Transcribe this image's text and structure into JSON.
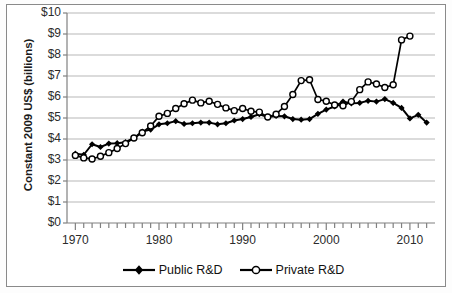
{
  "chart_data": {
    "type": "line",
    "title": "",
    "xlabel": "",
    "ylabel": "Constant 2009 US$ (billions)",
    "xlim": [
      1969,
      2013
    ],
    "ylim": [
      0,
      10
    ],
    "xticks": [
      1970,
      1980,
      1990,
      2000,
      2010
    ],
    "xtick_labels": [
      "1970",
      "1980",
      "1990",
      "2000",
      "2010"
    ],
    "yticks": [
      0,
      1,
      2,
      3,
      4,
      5,
      6,
      7,
      8,
      9,
      10
    ],
    "ytick_labels": [
      "$0",
      "$1",
      "$2",
      "$3",
      "$4",
      "$5",
      "$6",
      "$7",
      "$8",
      "$9",
      "$10"
    ],
    "grid": "horizontal",
    "legend_position": "bottom-center",
    "x": [
      1970,
      1971,
      1972,
      1973,
      1974,
      1975,
      1976,
      1977,
      1978,
      1979,
      1980,
      1981,
      1982,
      1983,
      1984,
      1985,
      1986,
      1987,
      1988,
      1989,
      1990,
      1991,
      1992,
      1993,
      1994,
      1995,
      1996,
      1997,
      1998,
      1999,
      2000,
      2001,
      2002,
      2003,
      2004,
      2005,
      2006,
      2007,
      2008,
      2009,
      2010,
      2011,
      2012
    ],
    "series": [
      {
        "name": "Public R&D",
        "marker": "filled-diamond",
        "color": "#000000",
        "values": [
          3.3,
          3.25,
          3.75,
          3.62,
          3.78,
          3.8,
          3.85,
          4.05,
          4.35,
          4.45,
          4.7,
          4.75,
          4.85,
          4.72,
          4.75,
          4.78,
          4.78,
          4.7,
          4.75,
          4.88,
          4.95,
          5.05,
          5.18,
          5.05,
          5.1,
          5.08,
          4.95,
          4.92,
          4.95,
          5.2,
          5.4,
          5.55,
          5.78,
          5.7,
          5.72,
          5.82,
          5.78,
          5.9,
          5.72,
          5.48,
          4.98,
          5.15,
          4.78
        ]
      },
      {
        "name": "Private R&D",
        "marker": "open-circle",
        "color": "#000000",
        "values": [
          3.22,
          3.1,
          3.05,
          3.18,
          3.35,
          3.55,
          3.78,
          4.05,
          4.3,
          4.62,
          5.08,
          5.22,
          5.45,
          5.68,
          5.85,
          5.72,
          5.8,
          5.65,
          5.48,
          5.35,
          5.45,
          5.32,
          5.28,
          5.05,
          5.18,
          5.55,
          6.12,
          6.78,
          6.82,
          5.88,
          5.8,
          5.62,
          5.58,
          5.78,
          6.35,
          6.72,
          6.62,
          6.45,
          6.58,
          8.72,
          8.9,
          null,
          null
        ]
      }
    ]
  },
  "legend": {
    "entries": [
      {
        "label": "Public R&D"
      },
      {
        "label": "Private R&D"
      }
    ]
  }
}
